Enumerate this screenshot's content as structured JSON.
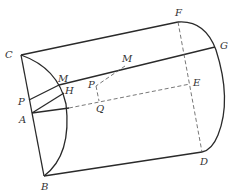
{
  "diagram": {
    "colors": {
      "line": "#2a2a2a",
      "dashed": "#555555",
      "text": "#333333"
    },
    "points": [
      {
        "id": "C",
        "label": "C",
        "x": 21,
        "y": 55
      },
      {
        "id": "M1",
        "label": "M",
        "x": 59,
        "y": 85
      },
      {
        "id": "P1",
        "label": "P",
        "x": 29,
        "y": 100
      },
      {
        "id": "H",
        "label": "H",
        "x": 66,
        "y": 95
      },
      {
        "id": "A",
        "label": "A",
        "x": 32,
        "y": 113
      },
      {
        "id": "B",
        "label": "B",
        "x": 44,
        "y": 176
      },
      {
        "id": "M2",
        "label": "M",
        "x": 125,
        "y": 66
      },
      {
        "id": "P2",
        "label": "P",
        "x": 96,
        "y": 86
      },
      {
        "id": "Q",
        "label": "Q",
        "x": 99,
        "y": 101
      },
      {
        "id": "F",
        "label": "F",
        "x": 178,
        "y": 22
      },
      {
        "id": "G",
        "label": "G",
        "x": 215,
        "y": 47
      },
      {
        "id": "E",
        "label": "E",
        "x": 190,
        "y": 84
      },
      {
        "id": "D",
        "label": "D",
        "x": 202,
        "y": 152
      }
    ],
    "solid_segments": [
      [
        "C",
        "F"
      ],
      [
        "C",
        "B"
      ],
      [
        "B",
        "D"
      ],
      [
        "M1",
        "G"
      ],
      [
        "P1",
        "M1"
      ],
      [
        "A",
        "H"
      ],
      [
        "A",
        "arc_point"
      ]
    ],
    "dashed_segments": [
      [
        "F",
        "D"
      ],
      [
        "A",
        "E"
      ],
      [
        "M2",
        "P2"
      ],
      [
        "P2",
        "Q"
      ]
    ],
    "arcs": [
      {
        "name": "left-semicircle",
        "from": "C",
        "to": "B",
        "through": [
          "M1",
          "H"
        ]
      },
      {
        "name": "right-semicircle",
        "from": "F",
        "to": "D",
        "through": [
          "G"
        ]
      }
    ]
  },
  "labels": {
    "C": "C",
    "M1": "M",
    "P1": "P",
    "H": "H",
    "A": "A",
    "B": "B",
    "M2": "M",
    "P2": "P",
    "Q": "Q",
    "F": "F",
    "G": "G",
    "E": "E",
    "D": "D"
  }
}
